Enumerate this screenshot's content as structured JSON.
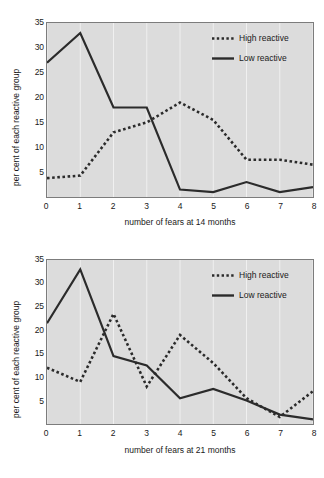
{
  "chart_data": [
    {
      "type": "line",
      "title": "",
      "xlabel": "number of fears at 14 months",
      "ylabel": "per cent of each reactive group",
      "x": [
        0,
        1,
        2,
        3,
        4,
        5,
        6,
        7,
        8
      ],
      "xticklabels": [
        "0",
        "1",
        "2",
        "3",
        "4",
        "5",
        "6",
        "7",
        "8"
      ],
      "yticks": [
        5,
        10,
        15,
        20,
        25,
        30,
        35
      ],
      "yticklabels": [
        "5",
        "10",
        "15",
        "20",
        "25",
        "30",
        "35"
      ],
      "xlim": [
        0,
        8
      ],
      "ylim": [
        0,
        35
      ],
      "grid": "vertical-white",
      "legend_position": "top-right",
      "series": [
        {
          "name": "High reactive",
          "style": "dotted",
          "color": "#2b2b2b",
          "values": [
            3.8,
            4.3,
            13.0,
            15.0,
            19.0,
            15.5,
            7.5,
            7.5,
            6.5
          ]
        },
        {
          "name": "Low reactive",
          "style": "solid",
          "color": "#2b2b2b",
          "values": [
            27.0,
            33.0,
            18.0,
            18.0,
            1.5,
            1.0,
            3.0,
            1.0,
            2.0
          ]
        }
      ]
    },
    {
      "type": "line",
      "title": "",
      "xlabel": "number of fears at 21 months",
      "ylabel": "per cent of each reactive group",
      "x": [
        0,
        1,
        2,
        3,
        4,
        5,
        6,
        7,
        8
      ],
      "xticklabels": [
        "0",
        "1",
        "2",
        "3",
        "4",
        "5",
        "6",
        "7",
        "8"
      ],
      "yticks": [
        5,
        10,
        15,
        20,
        25,
        30,
        35
      ],
      "yticklabels": [
        "5",
        "10",
        "15",
        "20",
        "25",
        "30",
        "35"
      ],
      "xlim": [
        0,
        8
      ],
      "ylim": [
        0,
        35
      ],
      "grid": "vertical-white",
      "legend_position": "top-right",
      "series": [
        {
          "name": "High reactive",
          "style": "dotted",
          "color": "#2b2b2b",
          "values": [
            12.0,
            9.0,
            23.5,
            8.0,
            19.0,
            13.0,
            5.5,
            1.5,
            7.0
          ]
        },
        {
          "name": "Low reactive",
          "style": "solid",
          "color": "#2b2b2b",
          "values": [
            21.5,
            33.0,
            14.5,
            12.5,
            5.5,
            7.5,
            5.0,
            2.0,
            1.0
          ]
        }
      ]
    }
  ],
  "charts": [
    {
      "id": "chart-1",
      "xlabel": "number of fears at 14 months",
      "ylabel": "per cent of each reactive group",
      "legend": [
        {
          "label": "High reactive"
        },
        {
          "label": "Low reactive"
        }
      ]
    },
    {
      "id": "chart-2",
      "xlabel": "number of fears at 21 months",
      "ylabel": "per cent of each reactive group",
      "legend": [
        {
          "label": "High reactive"
        },
        {
          "label": "Low reactive"
        }
      ]
    }
  ]
}
